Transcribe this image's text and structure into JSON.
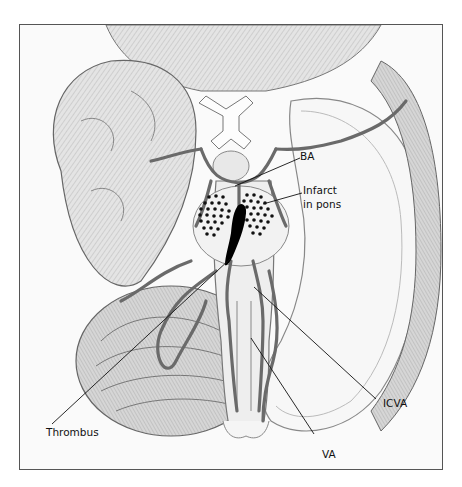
{
  "figure": {
    "labels": {
      "ba": "BA",
      "infarct_line1": "Infarct",
      "infarct_line2": "in pons",
      "thrombus": "Thrombus",
      "icva": "ICVA",
      "va": "VA"
    },
    "colors": {
      "frame": "#555555",
      "background": "#fafafa",
      "vessel": "#6a6a6a",
      "tissue_shade": "#bdbdbd",
      "thrombus": "#000000",
      "leader_line": "#111111"
    }
  }
}
